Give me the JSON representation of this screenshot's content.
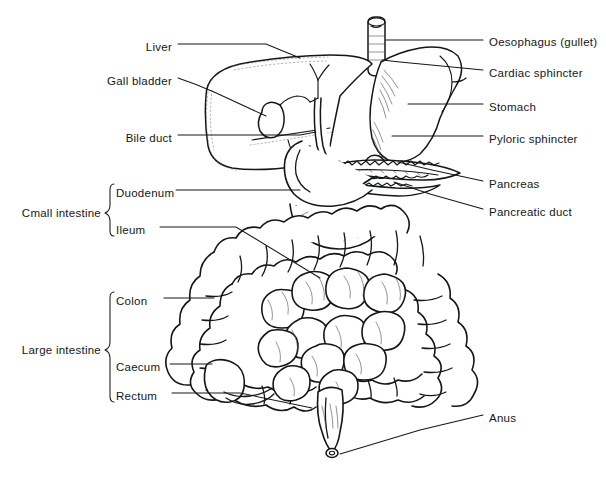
{
  "figure": {
    "background_color": "#ffffff",
    "ink_color": "#14171a",
    "style": "black-and-white line drawing"
  },
  "labels_left": [
    {
      "id": "liver",
      "text": "Liver",
      "x": 172,
      "y": 47
    },
    {
      "id": "gall-bladder",
      "text": "Gall bladder",
      "x": 172,
      "y": 81
    },
    {
      "id": "bile-duct",
      "text": "Bile duct",
      "x": 172,
      "y": 138
    }
  ],
  "labels_right": [
    {
      "id": "oesophagus",
      "text": "Oesophagus (gullet)",
      "x": 489,
      "y": 42
    },
    {
      "id": "cardiac-sphincter",
      "text": "Cardiac sphincter",
      "x": 489,
      "y": 73
    },
    {
      "id": "stomach",
      "text": "Stomach",
      "x": 489,
      "y": 107
    },
    {
      "id": "pyloric-sphincter",
      "text": "Pyloric sphincter",
      "x": 489,
      "y": 139
    },
    {
      "id": "pancreas",
      "text": "Pancreas",
      "x": 489,
      "y": 184
    },
    {
      "id": "pancreatic-duct",
      "text": "Pancreatic duct",
      "x": 489,
      "y": 212
    },
    {
      "id": "anus",
      "text": "Anus",
      "x": 489,
      "y": 418
    }
  ],
  "groups": [
    {
      "id": "small-intestine",
      "text": "Cmall intestine",
      "x": 104,
      "y": 213,
      "bracket": {
        "top": 184,
        "bottom": 236,
        "x": 110
      },
      "members": [
        {
          "id": "duodenum",
          "text": "Duodenum",
          "x": 116,
          "y": 193
        },
        {
          "id": "ileum",
          "text": "Ileum",
          "x": 116,
          "y": 230
        }
      ]
    },
    {
      "id": "large-intestine",
      "text": "Large intestine",
      "x": 104,
      "y": 350,
      "bracket": {
        "top": 292,
        "bottom": 402,
        "x": 110
      },
      "members": [
        {
          "id": "colon",
          "text": "Colon",
          "x": 116,
          "y": 301
        },
        {
          "id": "caecum",
          "text": "Caecum",
          "x": 116,
          "y": 367
        },
        {
          "id": "rectum",
          "text": "Rectum",
          "x": 116,
          "y": 396
        }
      ]
    }
  ],
  "organs": [
    {
      "id": "oesophagus",
      "name": "Oesophagus (gullet)"
    },
    {
      "id": "cardiac-sphincter",
      "name": "Cardiac sphincter"
    },
    {
      "id": "stomach",
      "name": "Stomach"
    },
    {
      "id": "pyloric-sphincter",
      "name": "Pyloric sphincter"
    },
    {
      "id": "liver",
      "name": "Liver"
    },
    {
      "id": "gall-bladder",
      "name": "Gall bladder"
    },
    {
      "id": "bile-duct",
      "name": "Bile duct"
    },
    {
      "id": "pancreas",
      "name": "Pancreas"
    },
    {
      "id": "pancreatic-duct",
      "name": "Pancreatic duct"
    },
    {
      "id": "duodenum",
      "name": "Duodenum"
    },
    {
      "id": "ileum",
      "name": "Ileum"
    },
    {
      "id": "colon",
      "name": "Colon"
    },
    {
      "id": "caecum",
      "name": "Caecum"
    },
    {
      "id": "rectum",
      "name": "Rectum"
    },
    {
      "id": "anus",
      "name": "Anus"
    }
  ]
}
